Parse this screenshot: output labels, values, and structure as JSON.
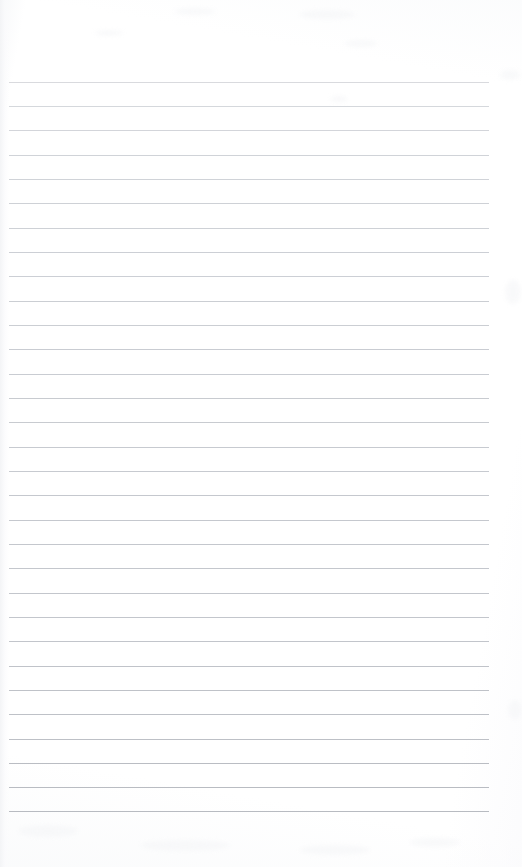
{
  "document": {
    "kind": "scanned-blank-lined-paper",
    "title": "",
    "body_text": "",
    "handwriting": "",
    "page_number": "",
    "header_text": "",
    "footer_text": ""
  },
  "page": {
    "width": 522,
    "height": 867,
    "background_color": "#ffffff",
    "paper_tone_color": "#fbfbfc"
  },
  "ruling": {
    "line_color": "#c9ccd2",
    "line_count": 31,
    "line_thickness": 1,
    "first_line_y": 82,
    "line_spacing": 24.3,
    "line_start_x": 9,
    "line_end_x": 489,
    "margin_top": 82,
    "margin_bottom": 57,
    "margin_right": 33,
    "margin_left": 9,
    "lines": [
      {
        "index": 1,
        "y": 82,
        "x1": 9,
        "x2": 489,
        "color": "#cfd1d6",
        "opacity": 0.8
      },
      {
        "index": 2,
        "y": 106,
        "x1": 9,
        "x2": 489,
        "color": "#cdd0d5",
        "opacity": 0.84
      },
      {
        "index": 3,
        "y": 130,
        "x1": 9,
        "x2": 489,
        "color": "#ccced4",
        "opacity": 0.86
      },
      {
        "index": 4,
        "y": 155,
        "x1": 9,
        "x2": 489,
        "color": "#cacdd3",
        "opacity": 0.88
      },
      {
        "index": 5,
        "y": 179,
        "x1": 9,
        "x2": 489,
        "color": "#cacdd3",
        "opacity": 0.88
      },
      {
        "index": 6,
        "y": 203,
        "x1": 9,
        "x2": 489,
        "color": "#c9ccd2",
        "opacity": 0.9
      },
      {
        "index": 7,
        "y": 228,
        "x1": 9,
        "x2": 489,
        "color": "#c9ccd2",
        "opacity": 0.9
      },
      {
        "index": 8,
        "y": 252,
        "x1": 9,
        "x2": 489,
        "color": "#c8cbd1",
        "opacity": 0.92
      },
      {
        "index": 9,
        "y": 276,
        "x1": 9,
        "x2": 489,
        "color": "#c8cbd1",
        "opacity": 0.92
      },
      {
        "index": 10,
        "y": 301,
        "x1": 9,
        "x2": 489,
        "color": "#c7cad0",
        "opacity": 0.93
      },
      {
        "index": 11,
        "y": 325,
        "x1": 9,
        "x2": 489,
        "color": "#c7cad0",
        "opacity": 0.93
      },
      {
        "index": 12,
        "y": 349,
        "x1": 9,
        "x2": 489,
        "color": "#c6c9cf",
        "opacity": 0.94
      },
      {
        "index": 13,
        "y": 374,
        "x1": 9,
        "x2": 489,
        "color": "#c6c9cf",
        "opacity": 0.94
      },
      {
        "index": 14,
        "y": 398,
        "x1": 9,
        "x2": 489,
        "color": "#c5c8ce",
        "opacity": 0.95
      },
      {
        "index": 15,
        "y": 422,
        "x1": 9,
        "x2": 489,
        "color": "#c5c8ce",
        "opacity": 0.95
      },
      {
        "index": 16,
        "y": 447,
        "x1": 9,
        "x2": 489,
        "color": "#c4c7cd",
        "opacity": 0.95
      },
      {
        "index": 17,
        "y": 471,
        "x1": 9,
        "x2": 489,
        "color": "#c4c7cd",
        "opacity": 0.95
      },
      {
        "index": 18,
        "y": 495,
        "x1": 9,
        "x2": 489,
        "color": "#c3c6cc",
        "opacity": 0.96
      },
      {
        "index": 19,
        "y": 520,
        "x1": 9,
        "x2": 489,
        "color": "#c3c6cc",
        "opacity": 0.96
      },
      {
        "index": 20,
        "y": 544,
        "x1": 9,
        "x2": 489,
        "color": "#c2c5cb",
        "opacity": 0.96
      },
      {
        "index": 21,
        "y": 568,
        "x1": 9,
        "x2": 489,
        "color": "#c2c5cb",
        "opacity": 0.96
      },
      {
        "index": 22,
        "y": 593,
        "x1": 9,
        "x2": 489,
        "color": "#c1c4ca",
        "opacity": 0.97
      },
      {
        "index": 23,
        "y": 617,
        "x1": 9,
        "x2": 489,
        "color": "#c1c4ca",
        "opacity": 0.97
      },
      {
        "index": 24,
        "y": 641,
        "x1": 9,
        "x2": 489,
        "color": "#c0c3c9",
        "opacity": 0.97
      },
      {
        "index": 25,
        "y": 666,
        "x1": 9,
        "x2": 489,
        "color": "#bfc2c8",
        "opacity": 0.98
      },
      {
        "index": 26,
        "y": 690,
        "x1": 9,
        "x2": 489,
        "color": "#bec1c7",
        "opacity": 0.98
      },
      {
        "index": 27,
        "y": 714,
        "x1": 9,
        "x2": 489,
        "color": "#bdc0c6",
        "opacity": 0.98
      },
      {
        "index": 28,
        "y": 739,
        "x1": 9,
        "x2": 489,
        "color": "#bcbfc5",
        "opacity": 0.99
      },
      {
        "index": 29,
        "y": 763,
        "x1": 9,
        "x2": 489,
        "color": "#babdc3",
        "opacity": 1.0
      },
      {
        "index": 30,
        "y": 787,
        "x1": 9,
        "x2": 489,
        "color": "#b9bcc2",
        "opacity": 1.0
      },
      {
        "index": 31,
        "y": 811,
        "x1": 9,
        "x2": 489,
        "color": "#b8bbc1",
        "opacity": 1.0
      }
    ]
  },
  "scan_artifacts": {
    "left_edge_visible": true,
    "smudges": [
      {
        "x": 300,
        "y": 10,
        "w": 55,
        "h": 9
      },
      {
        "x": 175,
        "y": 8,
        "w": 40,
        "h": 7
      },
      {
        "x": 95,
        "y": 30,
        "w": 28,
        "h": 6
      },
      {
        "x": 345,
        "y": 40,
        "w": 32,
        "h": 7
      },
      {
        "x": 330,
        "y": 96,
        "w": 18,
        "h": 6
      },
      {
        "x": 500,
        "y": 70,
        "w": 20,
        "h": 10
      },
      {
        "x": 18,
        "y": 825,
        "w": 60,
        "h": 12
      },
      {
        "x": 140,
        "y": 840,
        "w": 90,
        "h": 11
      },
      {
        "x": 300,
        "y": 845,
        "w": 70,
        "h": 10
      },
      {
        "x": 410,
        "y": 838,
        "w": 50,
        "h": 9
      },
      {
        "x": 505,
        "y": 280,
        "w": 16,
        "h": 24
      },
      {
        "x": 508,
        "y": 700,
        "w": 14,
        "h": 20
      }
    ]
  }
}
